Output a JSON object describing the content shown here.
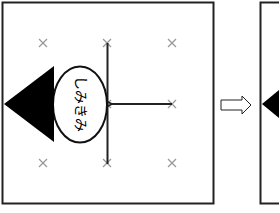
{
  "diagram": {
    "panels": [
      {
        "id": "panel-before",
        "grid_marks": 9,
        "robot_label": "しみきみ",
        "robot_label_rotation_deg": 90
      },
      {
        "id": "panel-after",
        "partial": true
      }
    ],
    "transition_arrow": "hollow-right-arrow",
    "colors": {
      "border": "#222222",
      "fill": "#000000",
      "grid_mark": "#9a9a9a",
      "background": "#ffffff"
    }
  }
}
